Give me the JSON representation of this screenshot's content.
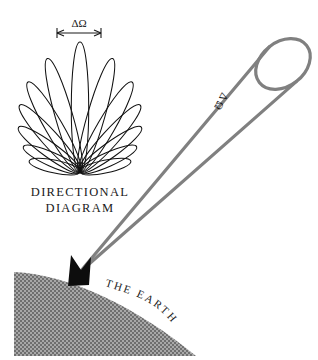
{
  "figure": {
    "background_color": "#ffffff",
    "width": 318,
    "height": 360
  },
  "labels": {
    "beam_angle_top": "ΔΩ",
    "beam_angle_cone": "Δ Ω",
    "directional_line1": "DIRECTIONAL",
    "directional_line2": "DIAGRAM",
    "earth": "THE EARTH"
  },
  "colors": {
    "ink": "#1a1a1a",
    "lobe_stroke": "#111111",
    "cone_stroke": "#808080",
    "earth_fill": "#8a8a8a",
    "antenna_fill": "#0d0d0d",
    "background": "#ffffff"
  },
  "diagram": {
    "lobe_origin_x": 80,
    "lobe_origin_y": 172,
    "lobe_count": 13,
    "lobe_lengths": [
      52,
      62,
      76,
      90,
      104,
      118,
      130,
      118,
      104,
      90,
      76,
      62,
      52
    ],
    "lobe_angles_deg": [
      -78,
      -66,
      -54,
      -42,
      -30,
      -16,
      0,
      16,
      30,
      42,
      54,
      66,
      78
    ],
    "lobe_widths": [
      11,
      12,
      13,
      14,
      15,
      15,
      15,
      15,
      15,
      14,
      13,
      12,
      11
    ],
    "cone_apex_x": 80,
    "cone_apex_y": 272,
    "cone_aperture_cx": 283,
    "cone_aperture_cy": 64,
    "cone_aperture_rx": 30,
    "cone_aperture_ry": 22,
    "cone_aperture_rotation_deg": -38,
    "earth_limb_start_x": 14,
    "earth_limb_start_y": 272,
    "earth_limb_end_x": 196,
    "earth_limb_end_y": 356,
    "dimension_bar_y": 33,
    "dimension_bar_x1": 57,
    "dimension_bar_x2": 101
  }
}
